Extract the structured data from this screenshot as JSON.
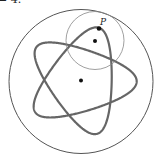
{
  "caption": "= 4.",
  "diagram": {
    "type": "hypotrochoid",
    "fixed_circle": {
      "cx": 81,
      "cy": 81.5,
      "r": 72,
      "stroke": "#555555"
    },
    "rolling_circle": {
      "cx": 95,
      "cy": 40.5,
      "r": 29,
      "stroke": "#888888"
    },
    "curve": {
      "R": 72,
      "r": 28.8,
      "d": 12.5,
      "rotation_deg": -71,
      "stroke": "#666666",
      "width": 2.2
    },
    "points": [
      {
        "name": "rolling-center",
        "x": 95,
        "y": 41
      },
      {
        "name": "fixed-center",
        "x": 81,
        "y": 80.5
      },
      {
        "name": "P",
        "x": 99,
        "y": 28.5
      }
    ],
    "label_P": "P"
  }
}
